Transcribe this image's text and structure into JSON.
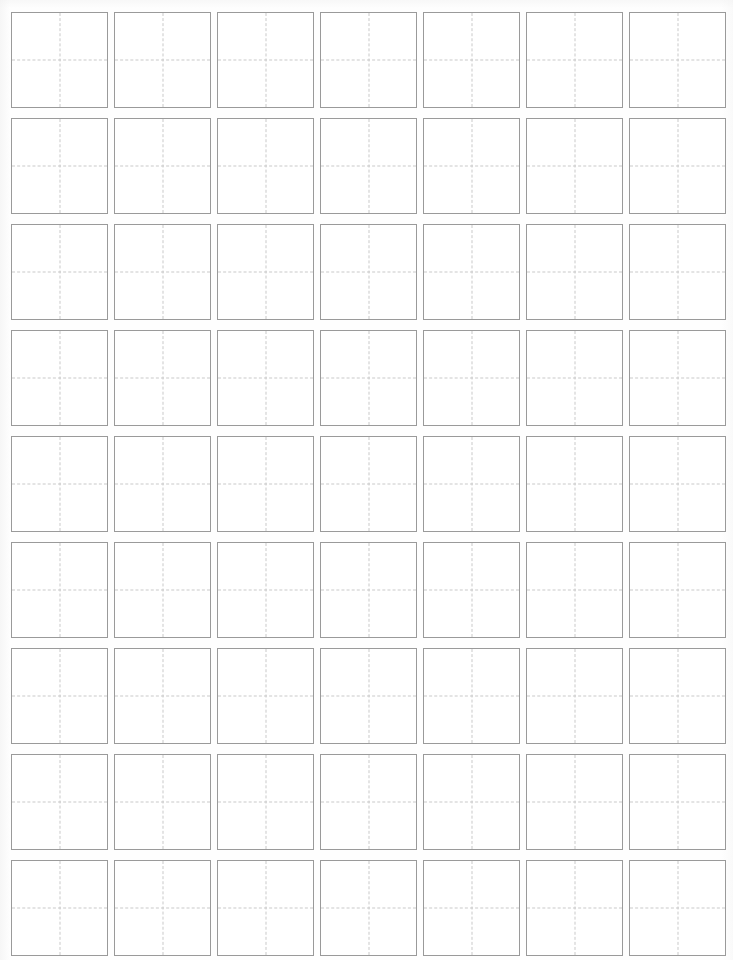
{
  "page": {
    "type": "tianzige-worksheet",
    "width": 733,
    "height": 960,
    "background_color": "#fefefe"
  },
  "grid": {
    "name": "character-practice-grid",
    "columns": 7,
    "rows": 9,
    "total_cells": 63,
    "cell_width": 97,
    "cell_height": 96,
    "column_gap": 6,
    "row_gap": 10,
    "origin_x": 11,
    "origin_y": 12,
    "border_color": "#9a9a9a",
    "guide_color": "#c9c9c9",
    "cell_background": "#ffffff",
    "guide_style": "dashed",
    "guides_per_cell": [
      "vertical-center",
      "horizontal-center"
    ]
  },
  "cells": [
    {
      "row": 1,
      "col": 1,
      "content": ""
    },
    {
      "row": 1,
      "col": 2,
      "content": ""
    },
    {
      "row": 1,
      "col": 3,
      "content": ""
    },
    {
      "row": 1,
      "col": 4,
      "content": ""
    },
    {
      "row": 1,
      "col": 5,
      "content": ""
    },
    {
      "row": 1,
      "col": 6,
      "content": ""
    },
    {
      "row": 1,
      "col": 7,
      "content": ""
    },
    {
      "row": 2,
      "col": 1,
      "content": ""
    },
    {
      "row": 2,
      "col": 2,
      "content": ""
    },
    {
      "row": 2,
      "col": 3,
      "content": ""
    },
    {
      "row": 2,
      "col": 4,
      "content": ""
    },
    {
      "row": 2,
      "col": 5,
      "content": ""
    },
    {
      "row": 2,
      "col": 6,
      "content": ""
    },
    {
      "row": 2,
      "col": 7,
      "content": ""
    },
    {
      "row": 3,
      "col": 1,
      "content": ""
    },
    {
      "row": 3,
      "col": 2,
      "content": ""
    },
    {
      "row": 3,
      "col": 3,
      "content": ""
    },
    {
      "row": 3,
      "col": 4,
      "content": ""
    },
    {
      "row": 3,
      "col": 5,
      "content": ""
    },
    {
      "row": 3,
      "col": 6,
      "content": ""
    },
    {
      "row": 3,
      "col": 7,
      "content": ""
    },
    {
      "row": 4,
      "col": 1,
      "content": ""
    },
    {
      "row": 4,
      "col": 2,
      "content": ""
    },
    {
      "row": 4,
      "col": 3,
      "content": ""
    },
    {
      "row": 4,
      "col": 4,
      "content": ""
    },
    {
      "row": 4,
      "col": 5,
      "content": ""
    },
    {
      "row": 4,
      "col": 6,
      "content": ""
    },
    {
      "row": 4,
      "col": 7,
      "content": ""
    },
    {
      "row": 5,
      "col": 1,
      "content": ""
    },
    {
      "row": 5,
      "col": 2,
      "content": ""
    },
    {
      "row": 5,
      "col": 3,
      "content": ""
    },
    {
      "row": 5,
      "col": 4,
      "content": ""
    },
    {
      "row": 5,
      "col": 5,
      "content": ""
    },
    {
      "row": 5,
      "col": 6,
      "content": ""
    },
    {
      "row": 5,
      "col": 7,
      "content": ""
    },
    {
      "row": 6,
      "col": 1,
      "content": ""
    },
    {
      "row": 6,
      "col": 2,
      "content": ""
    },
    {
      "row": 6,
      "col": 3,
      "content": ""
    },
    {
      "row": 6,
      "col": 4,
      "content": ""
    },
    {
      "row": 6,
      "col": 5,
      "content": ""
    },
    {
      "row": 6,
      "col": 6,
      "content": ""
    },
    {
      "row": 6,
      "col": 7,
      "content": ""
    },
    {
      "row": 7,
      "col": 1,
      "content": ""
    },
    {
      "row": 7,
      "col": 2,
      "content": ""
    },
    {
      "row": 7,
      "col": 3,
      "content": ""
    },
    {
      "row": 7,
      "col": 4,
      "content": ""
    },
    {
      "row": 7,
      "col": 5,
      "content": ""
    },
    {
      "row": 7,
      "col": 6,
      "content": ""
    },
    {
      "row": 7,
      "col": 7,
      "content": ""
    },
    {
      "row": 8,
      "col": 1,
      "content": ""
    },
    {
      "row": 8,
      "col": 2,
      "content": ""
    },
    {
      "row": 8,
      "col": 3,
      "content": ""
    },
    {
      "row": 8,
      "col": 4,
      "content": ""
    },
    {
      "row": 8,
      "col": 5,
      "content": ""
    },
    {
      "row": 8,
      "col": 6,
      "content": ""
    },
    {
      "row": 8,
      "col": 7,
      "content": ""
    },
    {
      "row": 9,
      "col": 1,
      "content": ""
    },
    {
      "row": 9,
      "col": 2,
      "content": ""
    },
    {
      "row": 9,
      "col": 3,
      "content": ""
    },
    {
      "row": 9,
      "col": 4,
      "content": ""
    },
    {
      "row": 9,
      "col": 5,
      "content": ""
    },
    {
      "row": 9,
      "col": 6,
      "content": ""
    },
    {
      "row": 9,
      "col": 7,
      "content": ""
    }
  ]
}
